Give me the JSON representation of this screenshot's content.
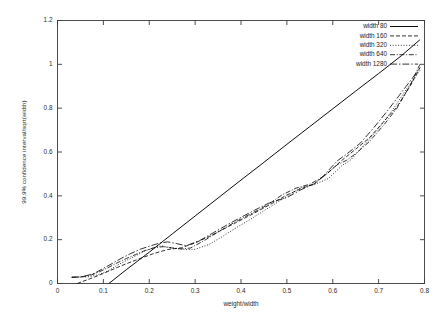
{
  "chart_data": {
    "type": "line",
    "title": "",
    "xlabel": "weight/width",
    "ylabel": "99.9% confidence interval/sqrt(width)",
    "xlim": [
      0,
      0.8
    ],
    "ylim": [
      0,
      1.2
    ],
    "xticks": [
      "0",
      "0.1",
      "0.2",
      "0.3",
      "0.4",
      "0.5",
      "0.6",
      "0.7",
      "0.8"
    ],
    "xtick_values": [
      0,
      0.1,
      0.2,
      0.3,
      0.4,
      0.5,
      0.6,
      0.7,
      0.8
    ],
    "yticks": [
      "0",
      "0.2",
      "0.4",
      "0.6",
      "0.8",
      "1",
      "1.2"
    ],
    "ytick_values": [
      0,
      0.2,
      0.4,
      0.6,
      0.8,
      1.0,
      1.2
    ],
    "grid": false,
    "legend_position": "top-right-inside",
    "line_color": "#000000",
    "background_color": "#ffffff",
    "series": [
      {
        "name": "width 80",
        "dash": "none",
        "x": [
          0.112,
          0.15,
          0.2,
          0.25,
          0.3,
          0.35,
          0.4,
          0.45,
          0.5,
          0.55,
          0.6,
          0.65,
          0.7,
          0.75,
          0.79
        ],
        "y": [
          0.0,
          0.063,
          0.143,
          0.226,
          0.308,
          0.39,
          0.472,
          0.553,
          0.635,
          0.716,
          0.797,
          0.878,
          0.958,
          1.04,
          1.112
        ]
      },
      {
        "name": "width 160",
        "dash": "dashed",
        "x": [
          0.043,
          0.07,
          0.09,
          0.11,
          0.13,
          0.15,
          0.18,
          0.21,
          0.24,
          0.27,
          0.3,
          0.33,
          0.36,
          0.39,
          0.42,
          0.45,
          0.47,
          0.5,
          0.53,
          0.56,
          0.59,
          0.62,
          0.65,
          0.68,
          0.71,
          0.74,
          0.77,
          0.79
        ],
        "y": [
          0.0,
          0.021,
          0.037,
          0.055,
          0.073,
          0.09,
          0.114,
          0.137,
          0.155,
          0.163,
          0.185,
          0.214,
          0.246,
          0.279,
          0.311,
          0.345,
          0.368,
          0.404,
          0.432,
          0.455,
          0.506,
          0.562,
          0.613,
          0.665,
          0.736,
          0.806,
          0.905,
          0.985
        ]
      },
      {
        "name": "width 320",
        "dash": "dotted",
        "x": [
          0.031,
          0.05,
          0.07,
          0.09,
          0.11,
          0.13,
          0.15,
          0.17,
          0.19,
          0.21,
          0.225,
          0.24,
          0.26,
          0.28,
          0.3,
          0.33,
          0.36,
          0.39,
          0.42,
          0.45,
          0.47,
          0.5,
          0.53,
          0.56,
          0.59,
          0.62,
          0.64,
          0.67,
          0.7,
          0.73,
          0.76,
          0.79
        ],
        "y": [
          0.028,
          0.029,
          0.031,
          0.041,
          0.058,
          0.083,
          0.105,
          0.126,
          0.148,
          0.163,
          0.172,
          0.166,
          0.159,
          0.155,
          0.156,
          0.178,
          0.215,
          0.255,
          0.292,
          0.332,
          0.358,
          0.398,
          0.437,
          0.452,
          0.478,
          0.538,
          0.565,
          0.637,
          0.706,
          0.79,
          0.885,
          0.972
        ]
      },
      {
        "name": "width 640",
        "dash": "dashdot",
        "x": [
          0.031,
          0.05,
          0.07,
          0.09,
          0.11,
          0.13,
          0.15,
          0.17,
          0.19,
          0.21,
          0.23,
          0.25,
          0.27,
          0.29,
          0.32,
          0.35,
          0.38,
          0.41,
          0.44,
          0.46,
          0.49,
          0.52,
          0.55,
          0.58,
          0.61,
          0.63,
          0.65,
          0.68,
          0.71,
          0.74,
          0.77,
          0.79
        ],
        "y": [
          0.029,
          0.03,
          0.036,
          0.052,
          0.072,
          0.094,
          0.114,
          0.132,
          0.15,
          0.163,
          0.168,
          0.162,
          0.158,
          0.162,
          0.196,
          0.235,
          0.272,
          0.306,
          0.338,
          0.362,
          0.405,
          0.435,
          0.453,
          0.488,
          0.542,
          0.562,
          0.592,
          0.648,
          0.72,
          0.8,
          0.91,
          1.0
        ]
      },
      {
        "name": "width 1280",
        "dash": "longdashdot",
        "x": [
          0.031,
          0.055,
          0.08,
          0.1,
          0.12,
          0.14,
          0.16,
          0.18,
          0.2,
          0.22,
          0.24,
          0.26,
          0.28,
          0.31,
          0.34,
          0.37,
          0.4,
          0.43,
          0.46,
          0.48,
          0.5,
          0.53,
          0.56,
          0.58,
          0.61,
          0.63,
          0.66,
          0.69,
          0.72,
          0.75,
          0.78,
          0.79
        ],
        "y": [
          0.028,
          0.031,
          0.046,
          0.069,
          0.092,
          0.116,
          0.137,
          0.156,
          0.17,
          0.183,
          0.19,
          0.182,
          0.172,
          0.196,
          0.232,
          0.268,
          0.302,
          0.335,
          0.366,
          0.38,
          0.392,
          0.427,
          0.455,
          0.492,
          0.56,
          0.59,
          0.64,
          0.712,
          0.79,
          0.872,
          0.955,
          0.985
        ]
      }
    ]
  }
}
